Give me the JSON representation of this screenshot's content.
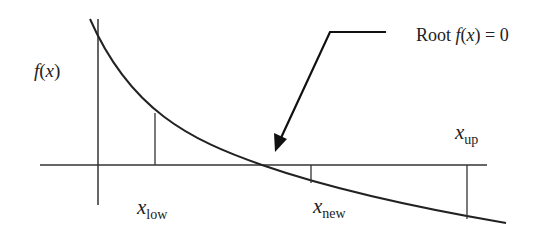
{
  "diagram": {
    "type": "bisection-method-illustration",
    "labels": {
      "y_axis": {
        "f": "f",
        "open": "(",
        "x": "x",
        "close": ")"
      },
      "root": {
        "prefix": "Root ",
        "f": "f",
        "open": "(",
        "x": "x",
        "close": ") = 0"
      },
      "x_low": {
        "base": "x",
        "sub": "low"
      },
      "x_new": {
        "base": "x",
        "sub": "new"
      },
      "x_up": {
        "base": "x",
        "sub": "up"
      }
    },
    "colors": {
      "line": "#222222",
      "background": "#ffffff"
    }
  }
}
